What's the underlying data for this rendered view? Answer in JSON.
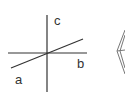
{
  "diagram": {
    "title": "",
    "axes": [
      {
        "name": "a",
        "label": "a"
      },
      {
        "name": "b",
        "label": "b"
      },
      {
        "name": "c",
        "label": "c"
      }
    ],
    "colors": {
      "line": "#333333",
      "background": "#ffffff",
      "crystal": "#777777"
    },
    "partial_shape": "crystal-outline"
  }
}
